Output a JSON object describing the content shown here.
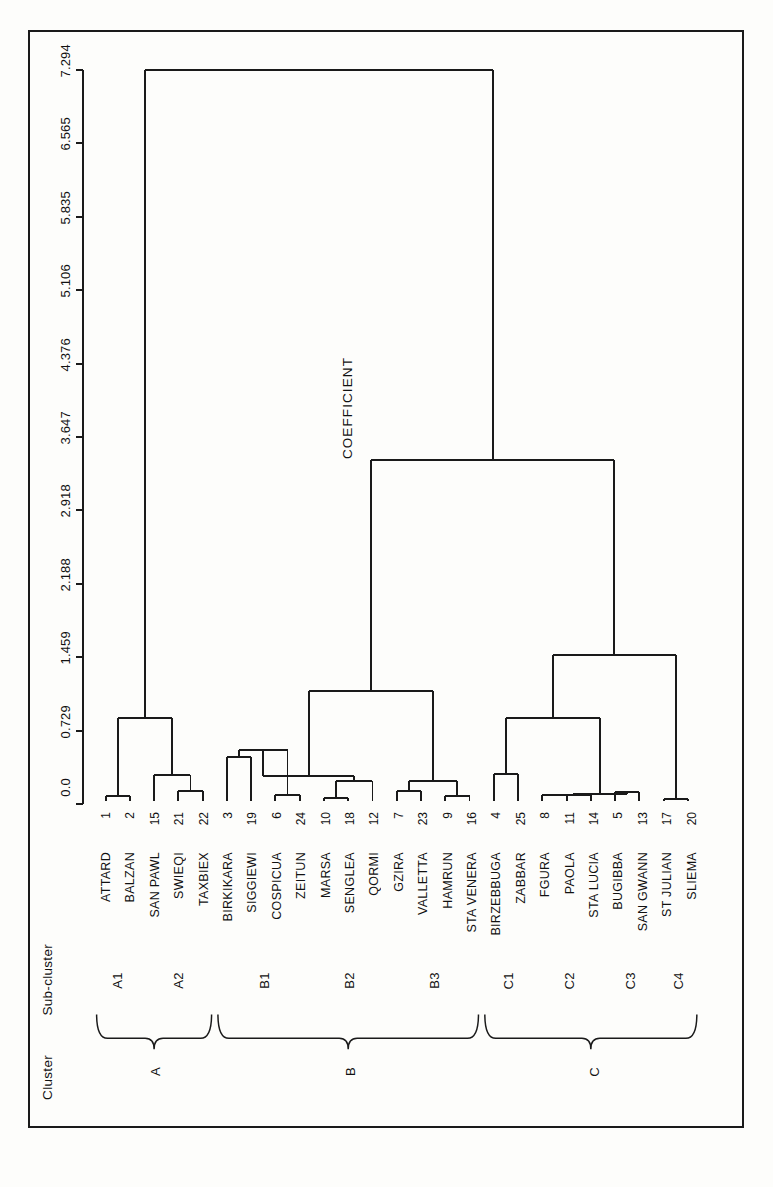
{
  "figure": {
    "headers": {
      "cluster": "Cluster",
      "subcluster": "Sub-cluster"
    },
    "axis_title": "COEFFICIENT"
  },
  "chart_data": {
    "type": "dendrogram",
    "title": "",
    "xlabel": "",
    "ylabel": "COEFFICIENT",
    "ylim": [
      0.0,
      7.294
    ],
    "grid": false,
    "legend": "none",
    "orientation": "leaves-along-x, coefficient-along-y",
    "axis_ticks": [
      "0.0",
      "0.729",
      "1.459",
      "2.188",
      "2.918",
      "3.647",
      "4.376",
      "5.106",
      "5.835",
      "6.565",
      "7.294"
    ],
    "axis_tick_values": [
      0.0,
      0.729,
      1.459,
      2.188,
      2.918,
      3.647,
      4.376,
      5.106,
      5.835,
      6.565,
      7.294
    ],
    "leaves": [
      {
        "num": "1",
        "label": "ATTARD",
        "cluster": "A",
        "subcluster": "A1"
      },
      {
        "num": "2",
        "label": "BALZAN",
        "cluster": "A",
        "subcluster": "A1"
      },
      {
        "num": "15",
        "label": "SAN PAWL",
        "cluster": "A",
        "subcluster": "A2"
      },
      {
        "num": "21",
        "label": "SWIEQI",
        "cluster": "A",
        "subcluster": "A2"
      },
      {
        "num": "22",
        "label": "TAXBIEX",
        "cluster": "A",
        "subcluster": "A2"
      },
      {
        "num": "3",
        "label": "BIRKIKARA",
        "cluster": "B",
        "subcluster": "B1"
      },
      {
        "num": "19",
        "label": "SIGGIEWI",
        "cluster": "B",
        "subcluster": "B1"
      },
      {
        "num": "6",
        "label": "COSPICUA",
        "cluster": "B",
        "subcluster": "B1"
      },
      {
        "num": "24",
        "label": "ZEITUN",
        "cluster": "B",
        "subcluster": "B1"
      },
      {
        "num": "10",
        "label": "MARSA",
        "cluster": "B",
        "subcluster": "B2"
      },
      {
        "num": "18",
        "label": "SENGLEA",
        "cluster": "B",
        "subcluster": "B2"
      },
      {
        "num": "12",
        "label": "QORMI",
        "cluster": "B",
        "subcluster": "B2"
      },
      {
        "num": "7",
        "label": "GZIRA",
        "cluster": "B",
        "subcluster": "B3"
      },
      {
        "num": "23",
        "label": "VALLETTA",
        "cluster": "B",
        "subcluster": "B3"
      },
      {
        "num": "9",
        "label": "HAMRUN",
        "cluster": "B",
        "subcluster": "B3"
      },
      {
        "num": "16",
        "label": "STA VENERA",
        "cluster": "B",
        "subcluster": "B3"
      },
      {
        "num": "4",
        "label": "BIRZEBBUGA",
        "cluster": "C",
        "subcluster": "C1"
      },
      {
        "num": "25",
        "label": "ZABBAR",
        "cluster": "C",
        "subcluster": "C1"
      },
      {
        "num": "8",
        "label": "FGURA",
        "cluster": "C",
        "subcluster": "C2"
      },
      {
        "num": "11",
        "label": "PAOLA",
        "cluster": "C",
        "subcluster": "C2"
      },
      {
        "num": "14",
        "label": "STA LUCIA",
        "cluster": "C",
        "subcluster": "C2"
      },
      {
        "num": "5",
        "label": "BUGIBBA",
        "cluster": "C",
        "subcluster": "C3"
      },
      {
        "num": "13",
        "label": "SAN GWANN",
        "cluster": "C",
        "subcluster": "C3"
      },
      {
        "num": "17",
        "label": "ST JULIAN",
        "cluster": "C",
        "subcluster": "C4"
      },
      {
        "num": "20",
        "label": "SLIEMA",
        "cluster": "C",
        "subcluster": "C4"
      }
    ],
    "merges": [
      {
        "id": "m1",
        "children": [
          "1",
          "2"
        ],
        "height": 0.05
      },
      {
        "id": "m2",
        "children": [
          "21",
          "22"
        ],
        "height": 0.1
      },
      {
        "id": "m3",
        "children": [
          "15",
          "m2"
        ],
        "height": 0.26
      },
      {
        "id": "m4",
        "children": [
          "m1",
          "m3"
        ],
        "height": 0.83
      },
      {
        "id": "m5",
        "children": [
          "3",
          "19"
        ],
        "height": 0.44
      },
      {
        "id": "m6",
        "children": [
          "6",
          "24"
        ],
        "height": 0.06
      },
      {
        "id": "m7",
        "children": [
          "m5",
          "m6"
        ],
        "height": 0.51
      },
      {
        "id": "m8",
        "children": [
          "10",
          "18"
        ],
        "height": 0.03
      },
      {
        "id": "m9",
        "children": [
          "m8",
          "12"
        ],
        "height": 0.2
      },
      {
        "id": "m10",
        "children": [
          "m7",
          "m9"
        ],
        "height": 0.25
      },
      {
        "id": "m11",
        "children": [
          "7",
          "23"
        ],
        "height": 0.1
      },
      {
        "id": "m12",
        "children": [
          "9",
          "16"
        ],
        "height": 0.05
      },
      {
        "id": "m13",
        "children": [
          "m11",
          "m12"
        ],
        "height": 0.2
      },
      {
        "id": "m14",
        "children": [
          "m10",
          "m13"
        ],
        "height": 1.1
      },
      {
        "id": "m15",
        "children": [
          "4",
          "25"
        ],
        "height": 0.27
      },
      {
        "id": "m16",
        "children": [
          "8",
          "11"
        ],
        "height": 0.06
      },
      {
        "id": "m17",
        "children": [
          "m16",
          "14"
        ],
        "height": 0.06
      },
      {
        "id": "m18",
        "children": [
          "5",
          "13"
        ],
        "height": 0.09
      },
      {
        "id": "m19",
        "children": [
          "m17",
          "m18"
        ],
        "height": 0.07
      },
      {
        "id": "m20",
        "children": [
          "m15",
          "m19"
        ],
        "height": 0.83
      },
      {
        "id": "m21",
        "children": [
          "17",
          "20"
        ],
        "height": 0.02
      },
      {
        "id": "m22",
        "children": [
          "m20",
          "m21"
        ],
        "height": 1.46
      },
      {
        "id": "m23",
        "children": [
          "m14",
          "m22"
        ],
        "height": 3.4
      },
      {
        "id": "m24",
        "children": [
          "m4",
          "m23"
        ],
        "height": 7.294
      }
    ],
    "clusters": [
      {
        "name": "A",
        "subclusters": [
          "A1",
          "A2"
        ],
        "first_leaf": 0,
        "last_leaf": 4
      },
      {
        "name": "B",
        "subclusters": [
          "B1",
          "B2",
          "B3"
        ],
        "first_leaf": 5,
        "last_leaf": 15
      },
      {
        "name": "C",
        "subclusters": [
          "C1",
          "C2",
          "C3",
          "C4"
        ],
        "first_leaf": 16,
        "last_leaf": 24
      }
    ],
    "subclusters": [
      {
        "name": "A1",
        "first_leaf": 0,
        "last_leaf": 1
      },
      {
        "name": "A2",
        "first_leaf": 2,
        "last_leaf": 4
      },
      {
        "name": "B1",
        "first_leaf": 5,
        "last_leaf": 8
      },
      {
        "name": "B2",
        "first_leaf": 9,
        "last_leaf": 11
      },
      {
        "name": "B3",
        "first_leaf": 12,
        "last_leaf": 15
      },
      {
        "name": "C1",
        "first_leaf": 16,
        "last_leaf": 17
      },
      {
        "name": "C2",
        "first_leaf": 18,
        "last_leaf": 20
      },
      {
        "name": "C3",
        "first_leaf": 21,
        "last_leaf": 22
      },
      {
        "name": "C4",
        "first_leaf": 23,
        "last_leaf": 24
      }
    ]
  }
}
